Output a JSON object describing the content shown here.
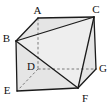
{
  "diagram": {
    "type": "geometry-solid",
    "canvas": {
      "width": 109,
      "height": 107,
      "background": "#ffffff"
    },
    "style": {
      "face_fill": "#e5e5e5",
      "section_fill": "#eeeeee",
      "solid_edge_color": "#1b1b1b",
      "solid_edge_width": 1.3,
      "hidden_edge_color": "#6b6b6b",
      "hidden_edge_width": 0.9,
      "hidden_dash": "2.6 2.2",
      "label_color": "#111111",
      "label_font_size": 11
    },
    "vertices": [
      {
        "id": "A",
        "x": 38,
        "y": 18,
        "label_x": 37.5,
        "label_y": 13.5,
        "hidden": false
      },
      {
        "id": "B",
        "x": 16,
        "y": 41,
        "label_x": 6.5,
        "label_y": 41.5,
        "hidden": false
      },
      {
        "id": "C",
        "x": 94,
        "y": 17,
        "label_x": 96,
        "label_y": 12.5,
        "hidden": false
      },
      {
        "id": "D",
        "x": 38,
        "y": 69,
        "label_x": 31,
        "label_y": 69.5,
        "hidden": true
      },
      {
        "id": "E",
        "x": 17,
        "y": 91,
        "label_x": 7,
        "label_y": 93.5,
        "hidden": false
      },
      {
        "id": "F",
        "x": 78,
        "y": 88,
        "label_x": 85,
        "label_y": 101.5,
        "hidden": false
      },
      {
        "id": "G",
        "x": 96,
        "y": 69,
        "label_x": 103,
        "label_y": 71.5,
        "hidden": false
      }
    ],
    "outline": [
      "E",
      "B",
      "A",
      "C",
      "G",
      "F"
    ],
    "section_face": [
      "B",
      "C",
      "F"
    ],
    "solid_edges": [
      [
        "E",
        "B"
      ],
      [
        "B",
        "A"
      ],
      [
        "A",
        "C"
      ],
      [
        "C",
        "G"
      ],
      [
        "G",
        "F"
      ],
      [
        "F",
        "E"
      ],
      [
        "B",
        "C"
      ],
      [
        "B",
        "F"
      ],
      [
        "C",
        "F"
      ]
    ],
    "hidden_edges": [
      [
        "A",
        "D"
      ],
      [
        "D",
        "G"
      ],
      [
        "D",
        "E"
      ]
    ]
  }
}
